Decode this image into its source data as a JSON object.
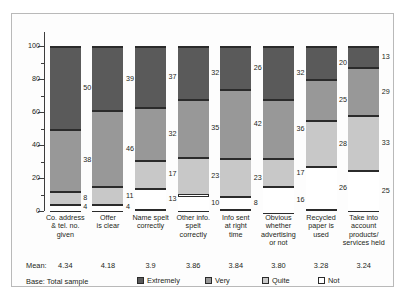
{
  "chart_data": {
    "type": "bar",
    "subtype": "stacked-bar-100-percent",
    "title": "",
    "xlabel": "",
    "ylabel": "",
    "ylim": [
      0,
      100
    ],
    "yticks": [
      0,
      20,
      40,
      60,
      80,
      100
    ],
    "grid": false,
    "legend_position": "bottom",
    "categories": [
      "Co. address & tel. no. given",
      "Offer is clear",
      "Name spelt correctly",
      "Other info. spelt correctly",
      "Info sent at right time",
      "Obvious whether advertising or not",
      "Recycled paper is used",
      "Take into account products/ services held"
    ],
    "category_lines": [
      [
        "Co. address",
        "& tel. no.",
        "given"
      ],
      [
        "Offer",
        "is clear"
      ],
      [
        "Name spelt",
        "correctly"
      ],
      [
        "Other info.",
        "spelt",
        "correctly"
      ],
      [
        "Info sent",
        "at right",
        "time"
      ],
      [
        "Obvious",
        "whether",
        "advertising",
        "or not"
      ],
      [
        "Recycled",
        "paper is",
        "used"
      ],
      [
        "Take into",
        "account",
        "products/",
        "services held"
      ]
    ],
    "series": [
      {
        "name": "Extremely",
        "color": "#5a5a5a",
        "values": [
          50,
          39,
          37,
          32,
          26,
          32,
          20,
          13
        ]
      },
      {
        "name": "Very",
        "color": "#989898",
        "values": [
          38,
          46,
          32,
          35,
          42,
          36,
          25,
          29
        ]
      },
      {
        "name": "Quite",
        "color": "#c8c8c8",
        "values": [
          8,
          11,
          17,
          23,
          23,
          17,
          28,
          33
        ]
      },
      {
        "name": "Not",
        "color": "#ffffff",
        "values": [
          4,
          4,
          13,
          10,
          8,
          16,
          26,
          25
        ]
      }
    ],
    "means": [
      "4.34",
      "4.18",
      "3.9",
      "3.86",
      "3.84",
      "3.80",
      "3.28",
      "3.24"
    ],
    "mean_row_label": "Mean:",
    "base_text": "Base: Total sample"
  },
  "legend": [
    {
      "label": "Extremely",
      "color": "#5a5a5a"
    },
    {
      "label": "Very",
      "color": "#989898"
    },
    {
      "label": "Quite",
      "color": "#c8c8c8"
    },
    {
      "label": "Not",
      "color": "#ffffff"
    }
  ],
  "caption": ""
}
